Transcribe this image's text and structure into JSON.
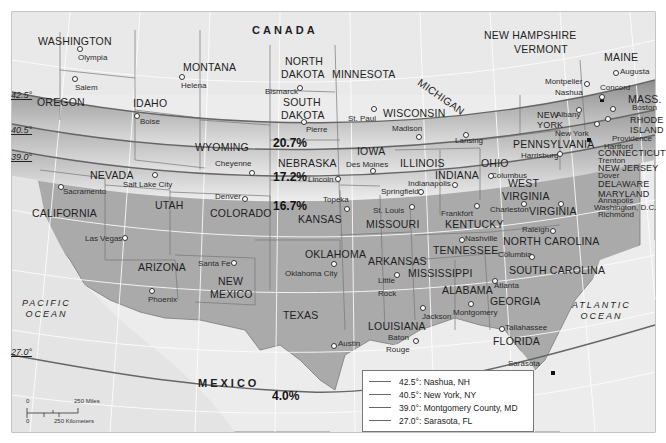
{
  "map": {
    "countries": [
      {
        "name": "CANADA",
        "x": 252,
        "y": 24
      },
      {
        "name": "MEXICO",
        "x": 198,
        "y": 378
      }
    ],
    "oceans": [
      {
        "name": "PACIFIC\nOCEAN",
        "line1": "PACIFIC",
        "line2": "OCEAN",
        "x": 22,
        "y": 298
      },
      {
        "name": "ATLANTIC\nOCEAN",
        "line1": "ATLANTIC",
        "line2": "OCEAN",
        "x": 572,
        "y": 300
      }
    ],
    "states": [
      {
        "name": "WASHINGTON",
        "x": 38,
        "y": 36
      },
      {
        "name": "OREGON",
        "x": 37,
        "y": 97
      },
      {
        "name": "IDAHO",
        "x": 133,
        "y": 98
      },
      {
        "name": "MONTANA",
        "x": 183,
        "y": 62
      },
      {
        "name": "NORTH",
        "x": 285,
        "y": 56
      },
      {
        "name": "DAKOTA",
        "x": 281,
        "y": 69
      },
      {
        "name": "SOUTH",
        "x": 283,
        "y": 97
      },
      {
        "name": "DAKOTA",
        "x": 281,
        "y": 110
      },
      {
        "name": "MINNESOTA",
        "x": 332,
        "y": 69
      },
      {
        "name": "WISCONSIN",
        "x": 383,
        "y": 108
      },
      {
        "name": "MICHIGAN",
        "x": 422,
        "y": 77
      },
      {
        "name": "WYOMING",
        "x": 195,
        "y": 142
      },
      {
        "name": "NEBRASKA",
        "x": 278,
        "y": 158
      },
      {
        "name": "IOWA",
        "x": 357,
        "y": 146
      },
      {
        "name": "ILLINOIS",
        "x": 400,
        "y": 158
      },
      {
        "name": "INDIANA",
        "x": 435,
        "y": 170
      },
      {
        "name": "OHIO",
        "x": 481,
        "y": 158
      },
      {
        "name": "NEVADA",
        "x": 90,
        "y": 170
      },
      {
        "name": "UTAH",
        "x": 155,
        "y": 200
      },
      {
        "name": "COLORADO",
        "x": 210,
        "y": 208
      },
      {
        "name": "KANSAS",
        "x": 298,
        "y": 214
      },
      {
        "name": "MISSOURI",
        "x": 366,
        "y": 219
      },
      {
        "name": "KENTUCKY",
        "x": 445,
        "y": 219
      },
      {
        "name": "WEST",
        "x": 508,
        "y": 178
      },
      {
        "name": "VIRGINIA",
        "x": 502,
        "y": 191
      },
      {
        "name": "VIRGINIA",
        "x": 529,
        "y": 206
      },
      {
        "name": "CALIFORNIA",
        "x": 32,
        "y": 208
      },
      {
        "name": "TENNESSEE",
        "x": 433,
        "y": 245
      },
      {
        "name": "NORTH CAROLINA",
        "x": 503,
        "y": 236
      },
      {
        "name": "ARIZONA",
        "x": 138,
        "y": 262
      },
      {
        "name": "NEW",
        "x": 218,
        "y": 276
      },
      {
        "name": "MEXICO",
        "x": 210,
        "y": 289
      },
      {
        "name": "OKLAHOMA",
        "x": 305,
        "y": 249
      },
      {
        "name": "ARKANSAS",
        "x": 368,
        "y": 256
      },
      {
        "name": "SOUTH CAROLINA",
        "x": 509,
        "y": 265
      },
      {
        "name": "MISSISSIPPI",
        "x": 408,
        "y": 268
      },
      {
        "name": "ALABAMA",
        "x": 442,
        "y": 285
      },
      {
        "name": "GEORGIA",
        "x": 490,
        "y": 296
      },
      {
        "name": "TEXAS",
        "x": 283,
        "y": 310
      },
      {
        "name": "LOUISIANA",
        "x": 368,
        "y": 321
      },
      {
        "name": "FLORIDA",
        "x": 493,
        "y": 336
      },
      {
        "name": "NEW HAMPSHIRE",
        "x": 484,
        "y": 30
      },
      {
        "name": "VERMONT",
        "x": 514,
        "y": 44
      },
      {
        "name": "MAINE",
        "x": 604,
        "y": 52
      },
      {
        "name": "MASS.",
        "x": 628,
        "y": 94
      },
      {
        "name": "NEW",
        "x": 537,
        "y": 111
      },
      {
        "name": "YORK",
        "x": 537,
        "y": 121
      },
      {
        "name": "RHODE",
        "x": 630,
        "y": 116
      },
      {
        "name": "ISLAND",
        "x": 630,
        "y": 126
      },
      {
        "name": "PENNSYLVANIA",
        "x": 513,
        "y": 139
      },
      {
        "name": "CONNECTICUT",
        "x": 598,
        "y": 149
      },
      {
        "name": "NEW JERSEY",
        "x": 598,
        "y": 164
      },
      {
        "name": "DELAWARE",
        "x": 598,
        "y": 180
      },
      {
        "name": "MARYLAND",
        "x": 598,
        "y": 190
      }
    ],
    "cities": [
      {
        "name": "Olympia",
        "x": 78,
        "y": 54,
        "dx": 79,
        "dy": 47
      },
      {
        "name": "Salem",
        "x": 75,
        "y": 84,
        "dx": 74,
        "dy": 77
      },
      {
        "name": "Helena",
        "x": 181,
        "y": 82,
        "dx": 181,
        "dy": 75
      },
      {
        "name": "Boise",
        "x": 140,
        "y": 118,
        "dx": 136,
        "dy": 114
      },
      {
        "name": "Bismarck",
        "x": 265,
        "y": 88,
        "dx": 299,
        "dy": 86
      },
      {
        "name": "Pierre",
        "x": 306,
        "y": 126,
        "dx": 303,
        "dy": 120
      },
      {
        "name": "St. Paul",
        "x": 348,
        "y": 115,
        "dx": 373,
        "dy": 107
      },
      {
        "name": "Madison",
        "x": 392,
        "y": 125,
        "dx": 418,
        "dy": 135
      },
      {
        "name": "Lansing",
        "x": 455,
        "y": 137,
        "dx": 465,
        "dy": 133
      },
      {
        "name": "Cheyenne",
        "x": 215,
        "y": 160,
        "dx": 251,
        "dy": 171
      },
      {
        "name": "Des Moines",
        "x": 346,
        "y": 161,
        "dx": 372,
        "dy": 169
      },
      {
        "name": "Lincoln",
        "x": 308,
        "y": 176,
        "dx": 337,
        "dy": 177
      },
      {
        "name": "Indianapolis",
        "x": 408,
        "y": 180,
        "dx": 454,
        "dy": 183
      },
      {
        "name": "Springfield",
        "x": 381,
        "y": 188,
        "dx": 420,
        "dy": 190
      },
      {
        "name": "Columbus",
        "x": 491,
        "y": 172,
        "dx": 494,
        "dy": 174
      },
      {
        "name": "Harrisburg",
        "x": 521,
        "y": 152,
        "dx": 559,
        "dy": 152
      },
      {
        "name": "Salt Lake City",
        "x": 123,
        "y": 181,
        "dx": 154,
        "dy": 173
      },
      {
        "name": "Sacramento",
        "x": 63,
        "y": 188,
        "dx": 60,
        "dy": 185
      },
      {
        "name": "Denver",
        "x": 215,
        "y": 193,
        "dx": 244,
        "dy": 197
      },
      {
        "name": "Topeka",
        "x": 323,
        "y": 196,
        "dx": 346,
        "dy": 207
      },
      {
        "name": "St. Louis",
        "x": 373,
        "y": 207,
        "dx": 411,
        "dy": 205
      },
      {
        "name": "Frankfort",
        "x": 441,
        "y": 210,
        "dx": 476,
        "dy": 204
      },
      {
        "name": "Charleston",
        "x": 490,
        "y": 206,
        "dx": 523,
        "dy": 202
      },
      {
        "name": "Richmond",
        "x": 598,
        "y": 211,
        "dx": 560,
        "dy": 202
      },
      {
        "name": "Las Vegas",
        "x": 85,
        "y": 235,
        "dx": 124,
        "dy": 236
      },
      {
        "name": "Santa Fe",
        "x": 198,
        "y": 260,
        "dx": 233,
        "dy": 261
      },
      {
        "name": "Oklahoma City",
        "x": 285,
        "y": 270,
        "dx": 333,
        "dy": 262
      },
      {
        "name": "Nashville",
        "x": 465,
        "y": 235,
        "dx": 461,
        "dy": 238
      },
      {
        "name": "Raleigh",
        "x": 522,
        "y": 226,
        "dx": 552,
        "dy": 229
      },
      {
        "name": "Columbia",
        "x": 498,
        "y": 251,
        "dx": 531,
        "dy": 255
      },
      {
        "name": "Phoenix",
        "x": 148,
        "y": 296,
        "dx": 151,
        "dy": 289
      },
      {
        "name": "Little",
        "x": 378,
        "y": 277,
        "dx": 396,
        "dy": 273
      },
      {
        "name": "Rock",
        "x": 378,
        "y": 290,
        "dx": 0,
        "dy": 0
      },
      {
        "name": "Atlanta",
        "x": 494,
        "y": 282,
        "dx": 494,
        "dy": 279
      },
      {
        "name": "Jackson",
        "x": 422,
        "y": 313,
        "dx": 422,
        "dy": 306
      },
      {
        "name": "Montgomery",
        "x": 453,
        "y": 309,
        "dx": 470,
        "dy": 302
      },
      {
        "name": "Austin",
        "x": 338,
        "y": 340,
        "dx": 333,
        "dy": 344
      },
      {
        "name": "Baton",
        "x": 388,
        "y": 334,
        "dx": 415,
        "dy": 339
      },
      {
        "name": "Rouge",
        "x": 386,
        "y": 346,
        "dx": 0,
        "dy": 0
      },
      {
        "name": "Tallahassee",
        "x": 505,
        "y": 324,
        "dx": 501,
        "dy": 327
      },
      {
        "name": "Sarasota",
        "x": 508,
        "y": 360,
        "dx": 531,
        "dy": 372
      },
      {
        "name": "Montpelier",
        "x": 545,
        "y": 78,
        "dx": 586,
        "dy": 82
      },
      {
        "name": "Nashua",
        "x": 555,
        "y": 89,
        "dx": 0,
        "dy": 0
      },
      {
        "name": "Augusta",
        "x": 620,
        "y": 68,
        "dx": 615,
        "dy": 71
      },
      {
        "name": "Concord",
        "x": 600,
        "y": 84,
        "dx": 601,
        "dy": 95
      },
      {
        "name": "Albany",
        "x": 556,
        "y": 111,
        "dx": 578,
        "dy": 108
      },
      {
        "name": "Boston",
        "x": 632,
        "y": 104,
        "dx": 612,
        "dy": 107
      },
      {
        "name": "New York",
        "x": 555,
        "y": 130,
        "dx": 0,
        "dy": 0
      },
      {
        "name": "Providence",
        "x": 612,
        "y": 135,
        "dx": 607,
        "dy": 117
      },
      {
        "name": "Hartford",
        "x": 604,
        "y": 143,
        "dx": 596,
        "dy": 122
      },
      {
        "name": "Trenton",
        "x": 598,
        "y": 157,
        "dx": 0,
        "dy": 0
      },
      {
        "name": "Dover",
        "x": 598,
        "y": 172,
        "dx": 0,
        "dy": 0
      },
      {
        "name": "Annapolis",
        "x": 598,
        "y": 197,
        "dx": 0,
        "dy": 0
      },
      {
        "name": "Washington, D.C.",
        "x": 594,
        "y": 204,
        "dx": 0,
        "dy": 0
      }
    ],
    "latitude_labels": [
      {
        "label": "42.5°",
        "x": 11,
        "y": 91
      },
      {
        "label": "40.5°",
        "x": 11,
        "y": 126
      },
      {
        "label": "39.0°",
        "x": 11,
        "y": 153
      },
      {
        "label": "27.0°",
        "x": 11,
        "y": 348
      }
    ],
    "percentages": [
      {
        "label": "20.7%",
        "x": 273,
        "y": 137
      },
      {
        "label": "17.2%",
        "x": 273,
        "y": 171
      },
      {
        "label": "16.7%",
        "x": 273,
        "y": 200
      },
      {
        "label": "4.0%",
        "x": 272,
        "y": 390
      }
    ],
    "scale_bar": {
      "miles_label": "250 Miles",
      "km_label": "250 Kilometers",
      "zero_top": "0",
      "zero_bottom": "0"
    },
    "legend": {
      "items": [
        {
          "latitude": "42.5°:",
          "place": "Nashua, NH"
        },
        {
          "latitude": "40.5°:",
          "place": "New York, NY"
        },
        {
          "latitude": "39.0°:",
          "place": "Montgomery County, MD"
        },
        {
          "latitude": "27.0°:",
          "place": "Sarasota, FL"
        }
      ]
    },
    "colors": {
      "land_light": "#e6e6e6",
      "water": "#f0f0f0",
      "band_dark": "#9a9a9a",
      "south_fill": "#a9a9a9",
      "border": "#7a7a7a",
      "graticule": "#ffffff"
    }
  }
}
